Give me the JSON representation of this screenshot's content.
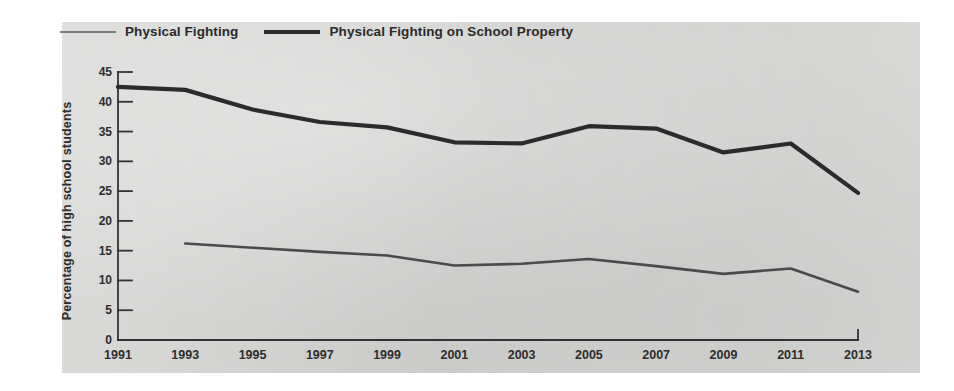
{
  "figure": {
    "panel_color": "#d6d6d4",
    "page_color": "#ffffff"
  },
  "legend": {
    "position": "top-left",
    "entries": [
      {
        "label": "Physical Fighting",
        "style": "thin",
        "color": "#5d5d5d"
      },
      {
        "label": "Physical Fighting on School Property",
        "style": "thick",
        "color": "#2b2b2b"
      }
    ]
  },
  "chart_data": {
    "type": "line",
    "title": "",
    "subtitle": "",
    "xlabel": "",
    "ylabel": "Percentage of high school students",
    "categories": [
      1991,
      1993,
      1995,
      1997,
      1999,
      2001,
      2003,
      2005,
      2007,
      2009,
      2011,
      2013
    ],
    "xtick_labels": [
      "1991",
      "1993",
      "1995",
      "1997",
      "1999",
      "2001",
      "2003",
      "2005",
      "2007",
      "2009",
      "2011",
      "2013"
    ],
    "ytick_labels": [
      "0",
      "5",
      "10",
      "15",
      "20",
      "25",
      "30",
      "35",
      "40",
      "45"
    ],
    "yticks": [
      0,
      5,
      10,
      15,
      20,
      25,
      30,
      35,
      40,
      45
    ],
    "ylim": [
      0,
      45
    ],
    "grid": false,
    "legend_position": "top-left",
    "series": [
      {
        "name": "Physical Fighting on School Property",
        "style": "thick",
        "color": "#2b2b2b",
        "x": [
          1991,
          1993,
          1995,
          1997,
          1999,
          2001,
          2003,
          2005,
          2007,
          2009,
          2011,
          2013
        ],
        "values": [
          42.5,
          42.0,
          38.7,
          36.6,
          35.7,
          33.2,
          33.0,
          35.9,
          35.5,
          31.5,
          33.0,
          24.7
        ]
      },
      {
        "name": "Physical Fighting",
        "style": "thin",
        "color": "#4a4a4a",
        "x": [
          1993,
          1995,
          1997,
          1999,
          2001,
          2003,
          2005,
          2007,
          2009,
          2011,
          2013
        ],
        "values": [
          16.2,
          15.5,
          14.8,
          14.2,
          12.5,
          12.8,
          13.6,
          12.4,
          11.1,
          12.0,
          8.1
        ]
      }
    ]
  }
}
